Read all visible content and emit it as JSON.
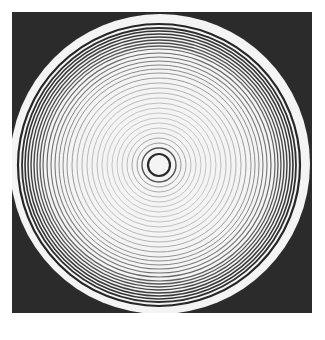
{
  "figure": {
    "background_color": "#2b2b2b",
    "disc_color": "#f4f4f4",
    "disc": {
      "cx": 148,
      "cy": 152,
      "rx": 150,
      "ry": 150
    },
    "center": {
      "cx": 147,
      "cy": 153
    },
    "rings": [
      {
        "r": 11,
        "w": 2.2,
        "c": "#2a2a2a"
      },
      {
        "r": 17,
        "w": 1.4,
        "c": "#555555"
      },
      {
        "r": 22,
        "w": 1.0,
        "c": "#999999"
      },
      {
        "r": 27,
        "w": 1.0,
        "c": "#aaaaaa"
      },
      {
        "r": 32,
        "w": 0.9,
        "c": "#b4b4b4"
      },
      {
        "r": 37,
        "w": 0.9,
        "c": "#bbbbbb"
      },
      {
        "r": 42,
        "w": 0.9,
        "c": "#bdbdbd"
      },
      {
        "r": 47,
        "w": 0.9,
        "c": "#c0c0c0"
      },
      {
        "r": 52,
        "w": 0.9,
        "c": "#c0c0c0"
      },
      {
        "r": 57,
        "w": 0.9,
        "c": "#bcbcbc"
      },
      {
        "r": 62,
        "w": 0.9,
        "c": "#b8b8b8"
      },
      {
        "r": 67,
        "w": 0.9,
        "c": "#b4b4b4"
      },
      {
        "r": 72,
        "w": 0.9,
        "c": "#b0b0b0"
      },
      {
        "r": 77,
        "w": 0.9,
        "c": "#aaaaaa"
      },
      {
        "r": 82,
        "w": 0.9,
        "c": "#a4a4a4"
      },
      {
        "r": 87,
        "w": 1.0,
        "c": "#9c9c9c"
      },
      {
        "r": 92,
        "w": 1.0,
        "c": "#949494"
      },
      {
        "r": 96,
        "w": 1.0,
        "c": "#8c8c8c"
      },
      {
        "r": 100,
        "w": 1.0,
        "c": "#858585"
      },
      {
        "r": 104,
        "w": 1.1,
        "c": "#7c7c7c"
      },
      {
        "r": 108,
        "w": 1.1,
        "c": "#747474"
      },
      {
        "r": 112,
        "w": 1.2,
        "c": "#6a6a6a"
      },
      {
        "r": 116,
        "w": 1.2,
        "c": "#626262"
      },
      {
        "r": 119,
        "w": 1.3,
        "c": "#585858"
      },
      {
        "r": 122,
        "w": 1.3,
        "c": "#505050"
      },
      {
        "r": 125,
        "w": 1.4,
        "c": "#484848"
      },
      {
        "r": 128,
        "w": 1.4,
        "c": "#404040"
      },
      {
        "r": 131,
        "w": 1.5,
        "c": "#3a3a3a"
      },
      {
        "r": 134,
        "w": 1.6,
        "c": "#333333"
      },
      {
        "r": 137,
        "w": 1.8,
        "c": "#2e2e2e"
      },
      {
        "r": 141,
        "w": 2.2,
        "c": "#262626"
      }
    ]
  },
  "caption": {
    "text": ""
  }
}
